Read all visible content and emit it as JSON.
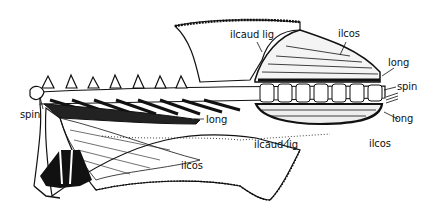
{
  "figure": {
    "colors": {
      "ink": "#111111",
      "background": "#ffffff"
    },
    "labels": [
      {
        "id": "ilcaud-lig-top",
        "text": "ilcaud lig",
        "x": 230,
        "y": 30
      },
      {
        "id": "ilcos-top",
        "text": "ilcos",
        "x": 338,
        "y": 29
      },
      {
        "id": "long-right-top",
        "text": "long",
        "x": 388,
        "y": 58
      },
      {
        "id": "spin-right",
        "text": "spin",
        "x": 397,
        "y": 82
      },
      {
        "id": "long-right-bottom",
        "text": "long",
        "x": 392,
        "y": 114
      },
      {
        "id": "ilcos-right-bottom",
        "text": "ilcos",
        "x": 369,
        "y": 139
      },
      {
        "id": "spin-left",
        "text": "spin",
        "x": 20,
        "y": 110
      },
      {
        "id": "long-center",
        "text": "long",
        "x": 206,
        "y": 115
      },
      {
        "id": "ilcaud-lig-center",
        "text": "ilcaud lig",
        "x": 254,
        "y": 140
      },
      {
        "id": "ilcos-center",
        "text": "ilcos",
        "x": 181,
        "y": 161
      }
    ]
  }
}
